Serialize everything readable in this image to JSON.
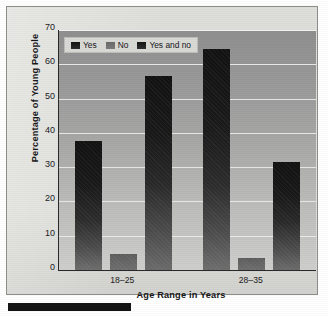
{
  "chart_data": {
    "type": "bar",
    "title": "",
    "xlabel": "Age Range in Years",
    "ylabel": "Percentage of Young People",
    "categories": [
      "18–25",
      "28–35"
    ],
    "series": [
      {
        "name": "Yes",
        "values": [
          37.5,
          64.5
        ]
      },
      {
        "name": "No",
        "values": [
          4.7,
          3.5
        ]
      },
      {
        "name": "Yes and no",
        "values": [
          56.5,
          31.5
        ]
      }
    ],
    "ylim": [
      0,
      70
    ],
    "yticks": [
      70,
      60,
      50,
      40,
      30,
      20,
      10,
      0
    ],
    "ytick_labels": [
      "70",
      "60",
      "50",
      "40",
      "30",
      "20",
      "10",
      "0"
    ],
    "grid": true,
    "legend_position": "top-left-inside",
    "colors": {
      "yes": "#1a1a1a",
      "no": "#6a6a6a",
      "yes_and_no": "#262626",
      "plot_background": "#a9a9a8",
      "panel_background": "#dededa",
      "gridline": "#ececeb",
      "axis": "#2a2a2a",
      "text": "#18181a"
    }
  },
  "legend": {
    "items": [
      {
        "label": "Yes",
        "icon": "legend-swatch-icon"
      },
      {
        "label": "No",
        "icon": "legend-swatch-icon"
      },
      {
        "label": "Yes and no",
        "icon": "legend-swatch-icon"
      }
    ]
  }
}
